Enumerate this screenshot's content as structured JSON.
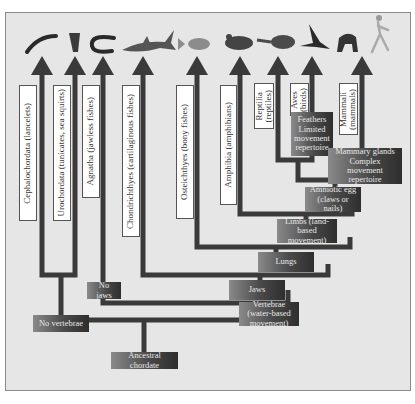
{
  "diagram": {
    "type": "phylogenetic-tree",
    "root": "Ancestral chordate",
    "taxa": [
      {
        "id": "cephalochordata",
        "label": "Cephalochordata (lancelets)",
        "icon": "lancelet-icon"
      },
      {
        "id": "urochordata",
        "label": "Urochordata (tunicates, sea squirts)",
        "icon": "tunicate-icon"
      },
      {
        "id": "agnatha",
        "label": "Agnatha (jawless fishes)",
        "icon": "lamprey-icon"
      },
      {
        "id": "chondrichthyes",
        "label": "Chondrichthyes (cartilaginous fishes)",
        "icon": "shark-icon"
      },
      {
        "id": "osteichthyes",
        "label": "Osteichthyes (bony fishes)",
        "icon": "bony-fish-icon"
      },
      {
        "id": "amphibia",
        "label": "Amphibia (amphibians)",
        "icon": "frog-icon"
      },
      {
        "id": "reptilia",
        "label_line1": "Reptilia",
        "label_line2": "(reptiles)",
        "icon": "turtle-icon"
      },
      {
        "id": "aves",
        "label_line1": "Aves",
        "label_line2": "(birds)",
        "icon": "bird-icon"
      },
      {
        "id": "mammalia",
        "label_line1": "Mammali",
        "label_line2": "(mammals)",
        "icon": "primate-human-icon"
      }
    ],
    "traits": {
      "ancestral": "Ancestral chordate",
      "no_vertebrae": "No vertebrae",
      "vertebrae": "Vertebrae (water-based movement)",
      "no_jaws": "No jaws",
      "jaws": "Jaws",
      "lungs": "Lungs",
      "limbs": "Limbs (land-based movement)",
      "amniotic_egg": "Amniotic egg (claws or nails)",
      "feathers_l1": "Feathers",
      "feathers_l2": "Limited movement repertoire",
      "mammary_l1": "Mammary glands",
      "mammary_l2": "Complex movement repertoire"
    },
    "colors": {
      "background": "#e6e6e6",
      "branch": "#3a3a3a",
      "trait_box_dark": "#2e2e2e",
      "trait_box_light": "#8a8a8a",
      "trait_text": "#e8e8e8",
      "label_box": "#ffffff"
    }
  }
}
